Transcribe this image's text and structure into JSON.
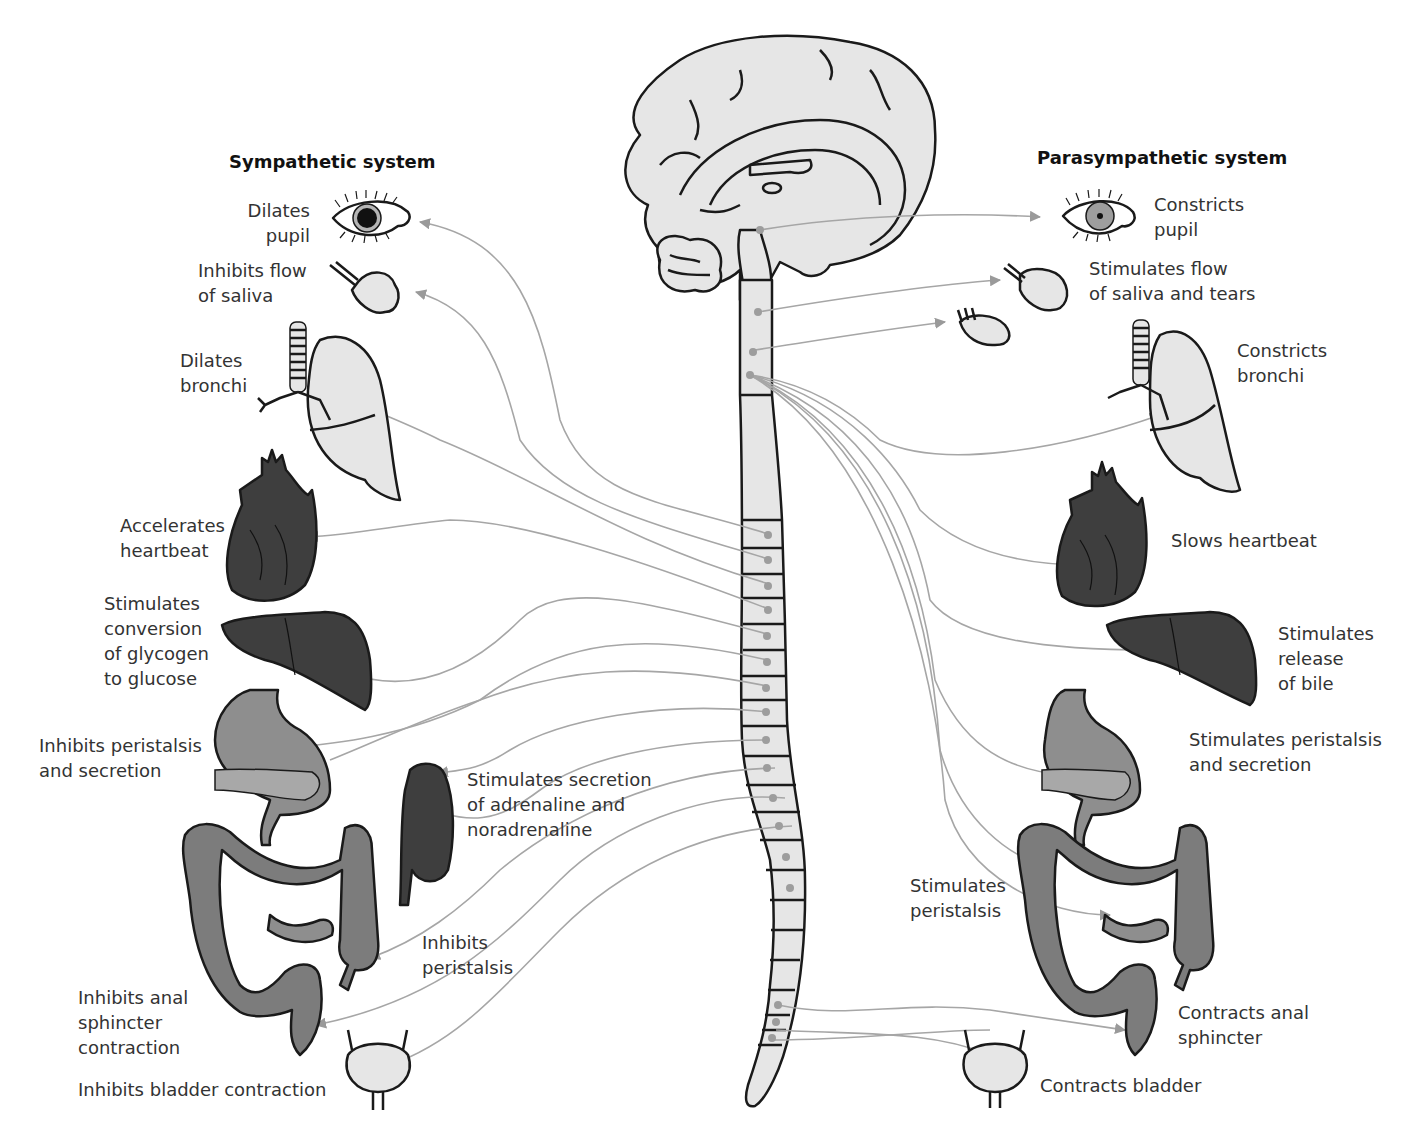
{
  "sympathetic": {
    "title": "Sympathetic system",
    "effects": {
      "eye": "Dilates\npupil",
      "saliva": "Inhibits flow\nof saliva",
      "bronchi": "Dilates\nbronchi",
      "heart": "Accelerates\nheartbeat",
      "liver": "Stimulates\nconversion\nof glycogen\nto glucose",
      "stomach": "Inhibits peristalsis\nand secretion",
      "adrenal": "Stimulates secretion\nof adrenaline and\nnoradrenaline",
      "intestine": "Inhibits\nperistalsis",
      "anal": "Inhibits anal\nsphincter\ncontraction",
      "bladder": "Inhibits bladder contraction"
    }
  },
  "parasympathetic": {
    "title": "Parasympathetic system",
    "effects": {
      "eye": "Constricts\npupil",
      "saliva": "Stimulates flow\nof saliva and tears",
      "bronchi": "Constricts\nbronchi",
      "heart": "Slows heartbeat",
      "liver": "Stimulates\nrelease\nof bile",
      "stomach": "Stimulates peristalsis\nand secretion",
      "intestine": "Stimulates\nperistalsis",
      "anal": "Contracts anal\nsphincter",
      "bladder": "Contracts bladder"
    }
  },
  "central": {
    "structures": [
      "brain",
      "brainstem",
      "spinal-cord"
    ]
  },
  "colors": {
    "organ_light": "#e6e6e6",
    "organ_mid": "#8e8e8e",
    "organ_dark": "#3e3e3e",
    "nerve": "#a6a6a6",
    "outline": "#1a1a1a"
  }
}
